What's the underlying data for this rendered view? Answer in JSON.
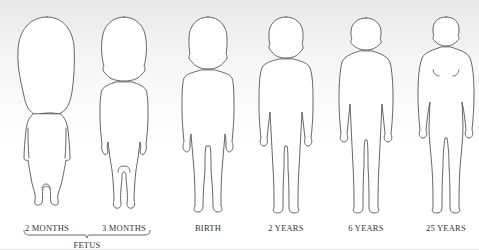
{
  "diagram": {
    "stages": [
      {
        "id": "2-months",
        "label": "2 MONTHS",
        "center_x": 47
      },
      {
        "id": "3-months",
        "label": "3 MONTHS",
        "center_x": 124
      },
      {
        "id": "birth",
        "label": "BIRTH",
        "center_x": 208
      },
      {
        "id": "2-years",
        "label": "2 YEARS",
        "center_x": 286
      },
      {
        "id": "6-years",
        "label": "6 YEARS",
        "center_x": 366
      },
      {
        "id": "25-years",
        "label": "25 YEARS",
        "center_x": 446
      }
    ],
    "groups": [
      {
        "label": "FETUS",
        "spans": [
          "2 MONTHS",
          "3 MONTHS"
        ]
      }
    ],
    "colors": {
      "outline": "#555555",
      "text": "#333333",
      "background_top": "#e9e9e9",
      "background_bottom": "#ffffff"
    }
  }
}
